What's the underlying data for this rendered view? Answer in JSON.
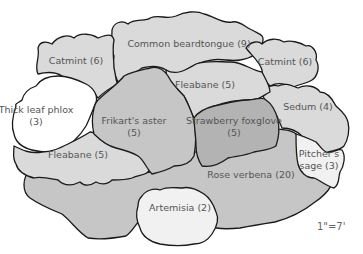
{
  "diagram": {
    "type": "garden-plan",
    "scale_label": "1\"=7'",
    "colors": {
      "light": "#dadada",
      "medium": "#c6c6c6",
      "dark": "#b3b3b3",
      "white": "#ffffff",
      "pale": "#f1f1f1",
      "outline": "#1a1a1a",
      "text": "#555555"
    },
    "beds": [
      {
        "id": "common-beardtongue",
        "name": "Common beardtongue",
        "count": 9,
        "label": "Common beardtongue (9)"
      },
      {
        "id": "catmint-left",
        "name": "Catmint",
        "count": 6,
        "label": "Catmint (6)"
      },
      {
        "id": "catmint-right",
        "name": "Catmint",
        "count": 6,
        "label": "Catmint (6)"
      },
      {
        "id": "thick-leaf-phlox",
        "name": "Thick leaf phlox",
        "count": 3,
        "label_line1": "Thick leaf phlox",
        "label_line2": "(3)"
      },
      {
        "id": "fleabane-top",
        "name": "Fleabane",
        "count": 5,
        "label": "Fleabane (5)"
      },
      {
        "id": "frikarts-aster",
        "name": "Frikart's aster",
        "count": 5,
        "label_line1": "Frikart's aster",
        "label_line2": "(5)"
      },
      {
        "id": "strawberry-foxglove",
        "name": "Strawberry foxglove",
        "count": 5,
        "label_line1": "Strawberry foxglove",
        "label_line2": "(5)"
      },
      {
        "id": "sedum",
        "name": "Sedum",
        "count": 4,
        "label": "Sedum (4)"
      },
      {
        "id": "fleabane-bottom",
        "name": "Fleabane",
        "count": 5,
        "label": "Fleabane (5)"
      },
      {
        "id": "pitchers-sage",
        "name": "Pitcher's sage",
        "count": 3,
        "label_line1": "Pitcher's",
        "label_line2": "sage (3)"
      },
      {
        "id": "rose-verbena",
        "name": "Rose verbena",
        "count": 20,
        "label": "Rose verbena (20)"
      },
      {
        "id": "artemisia",
        "name": "Artemisia",
        "count": 2,
        "label": "Artemisia (2)"
      }
    ]
  }
}
